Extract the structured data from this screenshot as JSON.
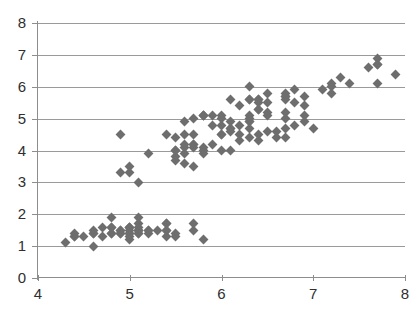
{
  "chart_data": {
    "type": "scatter",
    "title": "",
    "subtitle": "",
    "xlabel": "",
    "ylabel": "",
    "xlim": [
      4,
      8
    ],
    "ylim": [
      0,
      8
    ],
    "xticks": [
      4,
      5,
      6,
      7,
      8
    ],
    "yticks": [
      0,
      1,
      2,
      3,
      4,
      5,
      6,
      7,
      8
    ],
    "grid": "horizontal",
    "legend": "none",
    "marker": "diamond",
    "marker_color": "#6e6e6e",
    "gridline_color": "#9a9a9a",
    "axis_color": "#8d8d8d",
    "background_color": "#ffffff",
    "series": [
      {
        "name": "points",
        "points": [
          [
            5.1,
            1.4
          ],
          [
            4.9,
            1.4
          ],
          [
            4.7,
            1.3
          ],
          [
            4.6,
            1.5
          ],
          [
            5.0,
            1.4
          ],
          [
            5.4,
            1.7
          ],
          [
            4.6,
            1.4
          ],
          [
            5.0,
            1.5
          ],
          [
            4.4,
            1.4
          ],
          [
            4.9,
            1.5
          ],
          [
            5.4,
            1.5
          ],
          [
            4.8,
            1.6
          ],
          [
            4.8,
            1.4
          ],
          [
            4.3,
            1.1
          ],
          [
            5.8,
            1.2
          ],
          [
            5.7,
            1.5
          ],
          [
            5.4,
            1.3
          ],
          [
            5.1,
            1.4
          ],
          [
            5.7,
            1.7
          ],
          [
            5.1,
            1.5
          ],
          [
            5.4,
            1.7
          ],
          [
            5.1,
            1.5
          ],
          [
            4.6,
            1.0
          ],
          [
            5.1,
            1.7
          ],
          [
            4.8,
            1.9
          ],
          [
            5.0,
            1.6
          ],
          [
            5.0,
            1.6
          ],
          [
            5.2,
            1.5
          ],
          [
            5.2,
            1.4
          ],
          [
            4.7,
            1.6
          ],
          [
            4.8,
            1.6
          ],
          [
            5.4,
            1.5
          ],
          [
            5.2,
            1.5
          ],
          [
            5.5,
            1.4
          ],
          [
            4.9,
            1.5
          ],
          [
            5.0,
            1.2
          ],
          [
            5.5,
            1.3
          ],
          [
            4.9,
            1.4
          ],
          [
            4.4,
            1.3
          ],
          [
            5.1,
            1.5
          ],
          [
            5.0,
            1.3
          ],
          [
            4.5,
            1.3
          ],
          [
            4.4,
            1.3
          ],
          [
            5.0,
            1.6
          ],
          [
            5.1,
            1.9
          ],
          [
            4.8,
            1.4
          ],
          [
            5.1,
            1.6
          ],
          [
            4.6,
            1.4
          ],
          [
            5.3,
            1.5
          ],
          [
            5.0,
            1.4
          ],
          [
            7.0,
            4.7
          ],
          [
            6.4,
            4.5
          ],
          [
            6.9,
            4.9
          ],
          [
            5.5,
            4.0
          ],
          [
            6.5,
            4.6
          ],
          [
            5.7,
            4.5
          ],
          [
            6.3,
            4.7
          ],
          [
            4.9,
            3.3
          ],
          [
            6.6,
            4.6
          ],
          [
            5.2,
            3.9
          ],
          [
            5.0,
            3.5
          ],
          [
            5.9,
            4.2
          ],
          [
            6.0,
            4.0
          ],
          [
            6.1,
            4.7
          ],
          [
            5.6,
            3.6
          ],
          [
            6.7,
            4.4
          ],
          [
            5.6,
            4.5
          ],
          [
            5.8,
            4.1
          ],
          [
            6.2,
            4.5
          ],
          [
            5.6,
            3.9
          ],
          [
            5.9,
            4.8
          ],
          [
            6.1,
            4.0
          ],
          [
            6.3,
            4.9
          ],
          [
            6.1,
            4.7
          ],
          [
            6.4,
            4.3
          ],
          [
            6.6,
            4.4
          ],
          [
            6.8,
            4.8
          ],
          [
            6.7,
            5.0
          ],
          [
            6.0,
            4.5
          ],
          [
            5.7,
            3.5
          ],
          [
            5.5,
            3.8
          ],
          [
            5.5,
            3.7
          ],
          [
            5.8,
            3.9
          ],
          [
            6.0,
            5.1
          ],
          [
            5.4,
            4.5
          ],
          [
            6.0,
            4.5
          ],
          [
            6.7,
            4.7
          ],
          [
            6.3,
            4.4
          ],
          [
            5.6,
            4.1
          ],
          [
            5.5,
            4.0
          ],
          [
            5.5,
            4.4
          ],
          [
            6.1,
            4.6
          ],
          [
            5.8,
            4.0
          ],
          [
            5.0,
            3.3
          ],
          [
            5.6,
            4.2
          ],
          [
            5.7,
            4.2
          ],
          [
            5.7,
            4.2
          ],
          [
            6.2,
            4.3
          ],
          [
            5.1,
            3.0
          ],
          [
            5.7,
            4.1
          ],
          [
            6.3,
            6.0
          ],
          [
            5.8,
            5.1
          ],
          [
            7.1,
            5.9
          ],
          [
            6.3,
            5.6
          ],
          [
            6.5,
            5.8
          ],
          [
            7.6,
            6.6
          ],
          [
            4.9,
            4.5
          ],
          [
            7.3,
            6.3
          ],
          [
            6.7,
            5.8
          ],
          [
            7.2,
            6.1
          ],
          [
            6.5,
            5.1
          ],
          [
            6.4,
            5.3
          ],
          [
            6.8,
            5.5
          ],
          [
            5.7,
            5.0
          ],
          [
            5.8,
            5.1
          ],
          [
            6.4,
            5.3
          ],
          [
            6.5,
            5.5
          ],
          [
            7.7,
            6.7
          ],
          [
            7.7,
            6.9
          ],
          [
            6.0,
            5.0
          ],
          [
            6.9,
            5.7
          ],
          [
            5.6,
            4.9
          ],
          [
            7.7,
            6.7
          ],
          [
            6.3,
            4.9
          ],
          [
            6.7,
            5.7
          ],
          [
            7.2,
            6.0
          ],
          [
            6.2,
            4.8
          ],
          [
            6.1,
            4.9
          ],
          [
            6.4,
            5.6
          ],
          [
            7.2,
            5.8
          ],
          [
            7.4,
            6.1
          ],
          [
            7.9,
            6.4
          ],
          [
            6.4,
            5.6
          ],
          [
            6.3,
            5.1
          ],
          [
            6.1,
            5.6
          ],
          [
            7.7,
            6.1
          ],
          [
            6.3,
            5.6
          ],
          [
            6.4,
            5.5
          ],
          [
            6.0,
            4.8
          ],
          [
            6.9,
            5.4
          ],
          [
            6.7,
            5.6
          ],
          [
            6.9,
            5.1
          ],
          [
            5.8,
            5.1
          ],
          [
            6.8,
            5.9
          ],
          [
            6.7,
            5.7
          ],
          [
            6.7,
            5.2
          ],
          [
            6.3,
            5.0
          ],
          [
            6.5,
            5.2
          ],
          [
            6.2,
            5.4
          ],
          [
            5.9,
            5.1
          ]
        ]
      }
    ]
  }
}
